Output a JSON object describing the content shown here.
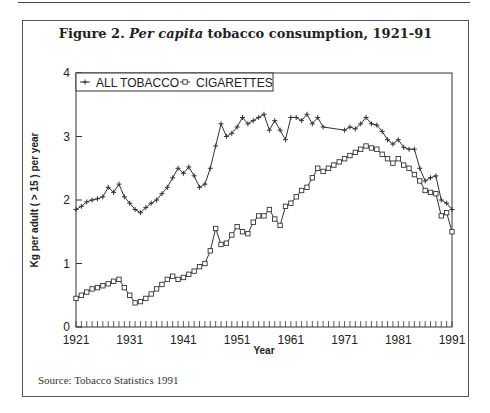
{
  "figure": {
    "title_prefix": "Figure 2. ",
    "title_italic": "Per capita",
    "title_suffix": " tobacco consumption, 1921-91",
    "source": "Source: Tobacco Statistics 1991"
  },
  "chart_data": {
    "type": "line",
    "title": "Figure 2. Per capita tobacco consumption, 1921-91",
    "xlabel": "Year",
    "ylabel": "Kg per adult ( > 15 ) per year",
    "xlim": [
      1921,
      1991
    ],
    "ylim": [
      0,
      4
    ],
    "x_ticks": [
      "1921",
      "1931",
      "1941",
      "1951",
      "1961",
      "1971",
      "1981",
      "1991"
    ],
    "y_ticks": [
      "0",
      "1",
      "2",
      "3",
      "4"
    ],
    "grid": false,
    "legend_position": "top-left inside",
    "series": [
      {
        "name": "ALL TOBACCO",
        "marker": "plus",
        "x": [
          1921,
          1922,
          1923,
          1924,
          1925,
          1926,
          1927,
          1928,
          1929,
          1930,
          1931,
          1932,
          1933,
          1934,
          1935,
          1936,
          1937,
          1938,
          1939,
          1940,
          1941,
          1942,
          1943,
          1944,
          1945,
          1946,
          1947,
          1948,
          1949,
          1950,
          1951,
          1952,
          1953,
          1954,
          1955,
          1956,
          1957,
          1958,
          1959,
          1960,
          1961,
          1962,
          1963,
          1964,
          1965,
          1966,
          1967,
          1971,
          1972,
          1973,
          1974,
          1975,
          1976,
          1977,
          1978,
          1979,
          1980,
          1981,
          1982,
          1983,
          1984,
          1985,
          1986,
          1987,
          1988,
          1989,
          1990,
          1991
        ],
        "values": [
          1.85,
          1.9,
          1.97,
          2.0,
          2.02,
          2.05,
          2.2,
          2.12,
          2.25,
          2.05,
          1.95,
          1.85,
          1.8,
          1.88,
          1.95,
          2.0,
          2.1,
          2.2,
          2.35,
          2.5,
          2.42,
          2.52,
          2.38,
          2.2,
          2.25,
          2.5,
          2.85,
          3.2,
          3.0,
          3.05,
          3.15,
          3.3,
          3.2,
          3.25,
          3.3,
          3.35,
          3.1,
          3.25,
          3.1,
          2.95,
          3.3,
          3.3,
          3.25,
          3.35,
          3.2,
          3.3,
          3.15,
          3.1,
          3.15,
          3.12,
          3.2,
          3.3,
          3.2,
          3.18,
          3.08,
          2.95,
          2.88,
          2.95,
          2.83,
          2.8,
          2.8,
          2.5,
          2.3,
          2.35,
          2.38,
          2.0,
          1.95,
          1.85
        ]
      },
      {
        "name": "CIGARETTES",
        "marker": "square",
        "x": [
          1921,
          1922,
          1923,
          1924,
          1925,
          1926,
          1927,
          1928,
          1929,
          1930,
          1931,
          1932,
          1933,
          1934,
          1935,
          1936,
          1937,
          1938,
          1939,
          1940,
          1941,
          1942,
          1943,
          1944,
          1945,
          1946,
          1947,
          1948,
          1949,
          1950,
          1951,
          1952,
          1953,
          1954,
          1955,
          1956,
          1957,
          1958,
          1959,
          1960,
          1961,
          1962,
          1963,
          1964,
          1965,
          1966,
          1967,
          1968,
          1969,
          1970,
          1971,
          1972,
          1973,
          1974,
          1975,
          1976,
          1977,
          1978,
          1979,
          1980,
          1981,
          1982,
          1983,
          1984,
          1985,
          1986,
          1987,
          1988,
          1989,
          1990,
          1991
        ],
        "values": [
          0.45,
          0.5,
          0.55,
          0.6,
          0.62,
          0.65,
          0.68,
          0.72,
          0.75,
          0.62,
          0.5,
          0.38,
          0.4,
          0.45,
          0.52,
          0.6,
          0.67,
          0.75,
          0.8,
          0.75,
          0.78,
          0.83,
          0.88,
          0.95,
          1.0,
          1.2,
          1.55,
          1.3,
          1.32,
          1.45,
          1.58,
          1.5,
          1.47,
          1.65,
          1.75,
          1.75,
          1.85,
          1.7,
          1.6,
          1.9,
          1.95,
          2.05,
          2.15,
          2.2,
          2.35,
          2.5,
          2.45,
          2.5,
          2.55,
          2.6,
          2.65,
          2.7,
          2.75,
          2.8,
          2.85,
          2.82,
          2.8,
          2.72,
          2.65,
          2.58,
          2.65,
          2.55,
          2.5,
          2.4,
          2.3,
          2.15,
          2.12,
          2.1,
          1.75,
          1.8,
          1.5
        ]
      }
    ]
  }
}
